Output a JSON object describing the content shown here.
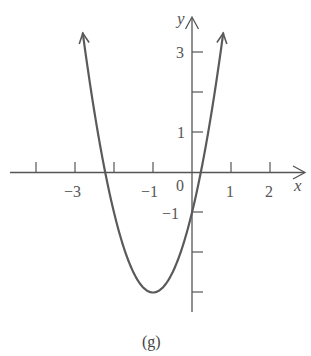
{
  "chart_data": {
    "type": "line",
    "title": "",
    "caption": "(g)",
    "xlabel": "x",
    "ylabel": "y",
    "function": "y = 2x^2 + 4x - 1 = 2(x+1)^2 - 3",
    "vertex": [
      -1,
      -3
    ],
    "y_intercept": -1,
    "x_intercepts": [
      -2.22,
      0.22
    ],
    "x_ticks": [
      -4,
      -3,
      -2,
      -1,
      0,
      1,
      2
    ],
    "x_tick_labels": [
      "-3",
      "-1",
      "0",
      "1",
      "2"
    ],
    "y_ticks": [
      3,
      2,
      1,
      -1,
      -2,
      -3
    ],
    "y_tick_labels": [
      "3",
      "1",
      "-1"
    ],
    "xlim": [
      -4.1,
      2.9
    ],
    "ylim": [
      -3.5,
      3.8
    ],
    "grid": false,
    "series": [
      {
        "name": "parabola",
        "x": [
          -2.8,
          -2.5,
          -2.22,
          -2,
          -1.5,
          -1,
          -0.5,
          0,
          0.22,
          0.5,
          0.8
        ],
        "values": [
          3.48,
          1.5,
          0.0,
          -1.0,
          -2.5,
          -3.0,
          -2.5,
          -1.0,
          0.0,
          1.5,
          3.48
        ]
      }
    ]
  },
  "labels": {
    "x_axis": "x",
    "y_axis": "y",
    "origin": "0",
    "caption": "(g)",
    "xt": {
      "m3": "−3",
      "m1": "−1",
      "p1": "1",
      "p2": "2"
    },
    "yt": {
      "p3": "3",
      "p1": "1",
      "m1": "−1"
    }
  },
  "colors": {
    "axis": "#555555",
    "curve": "#5a5a5a"
  }
}
